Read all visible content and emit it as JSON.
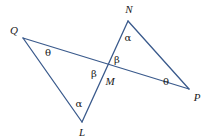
{
  "figure": {
    "width": 208,
    "height": 138,
    "background_color": "#ffffff",
    "line_color": "#3a5a8c",
    "line_width": 1.3,
    "label_color": "#1a1a1a"
  },
  "points": {
    "Q": {
      "label": "Q",
      "x": 23,
      "y": 38
    },
    "N": {
      "label": "N",
      "x": 128,
      "y": 21
    },
    "L": {
      "label": "L",
      "x": 82,
      "y": 122
    },
    "P": {
      "label": "P",
      "x": 189,
      "y": 89
    },
    "M": {
      "label": "M",
      "x": 104,
      "y": 70
    }
  },
  "vertex_labels": [
    {
      "name": "point-label-Q",
      "text": "Q",
      "x": 14,
      "y": 30
    },
    {
      "name": "point-label-N",
      "text": "N",
      "x": 129,
      "y": 9
    },
    {
      "name": "point-label-L",
      "text": "L",
      "x": 82,
      "y": 132
    },
    {
      "name": "point-label-P",
      "text": "P",
      "x": 197,
      "y": 97
    },
    {
      "name": "point-label-M",
      "text": "M",
      "x": 110,
      "y": 81
    }
  ],
  "angle_labels": [
    {
      "name": "angle-theta-at-Q",
      "text": "θ",
      "x": 48,
      "y": 53,
      "vertex": "Q"
    },
    {
      "name": "angle-alpha-at-N",
      "text": "α",
      "x": 128,
      "y": 38,
      "vertex": "N"
    },
    {
      "name": "angle-beta-at-M-right",
      "text": "β",
      "x": 117,
      "y": 60,
      "vertex": "M"
    },
    {
      "name": "angle-beta-at-M-left",
      "text": "β",
      "x": 94,
      "y": 74,
      "vertex": "M"
    },
    {
      "name": "angle-alpha-at-L",
      "text": "α",
      "x": 79,
      "y": 104,
      "vertex": "L"
    },
    {
      "name": "angle-theta-at-P",
      "text": "θ",
      "x": 166,
      "y": 82,
      "vertex": "P"
    }
  ],
  "segments": [
    {
      "name": "segment-Q-P",
      "from": "Q",
      "to": "P"
    },
    {
      "name": "segment-Q-L",
      "from": "Q",
      "to": "L"
    },
    {
      "name": "segment-N-L",
      "from": "N",
      "to": "L"
    },
    {
      "name": "segment-N-P",
      "from": "N",
      "to": "P"
    }
  ]
}
